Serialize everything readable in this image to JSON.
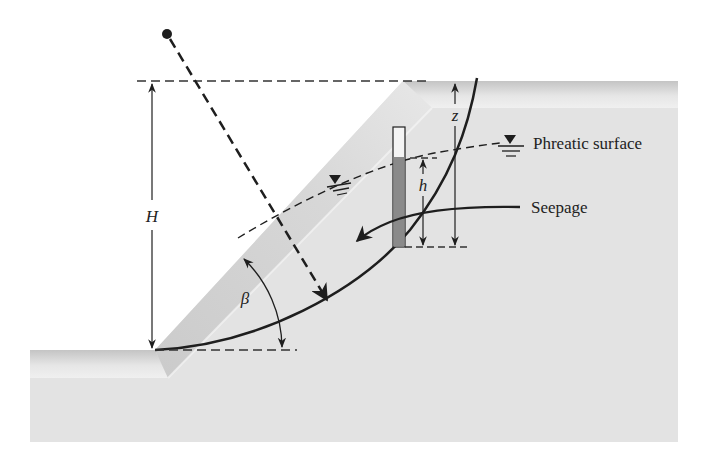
{
  "diagram": {
    "labels": {
      "H": "H",
      "beta": "β",
      "h": "h",
      "z": "z",
      "phreatic_surface": "Phreatic surface",
      "seepage": "Seepage"
    },
    "colors": {
      "soil": "#e4e4e4",
      "soil_dark": "#c9c9c9",
      "line": "#1e1e1e",
      "dashed": "#333333",
      "piezometer_fill": "#8a8a8a",
      "background": "#ffffff"
    }
  }
}
